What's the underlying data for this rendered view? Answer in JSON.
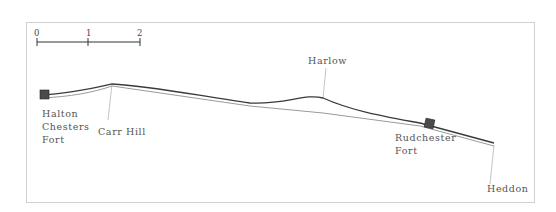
{
  "scale_bar": {
    "ticks": [
      "0",
      "1",
      "2"
    ]
  },
  "places": {
    "halton": {
      "lines": [
        "Halton",
        "Chesters",
        "Fort"
      ]
    },
    "carr_hill": {
      "label": "Carr Hill"
    },
    "harlow": {
      "label": "Harlow"
    },
    "rudchester": {
      "lines": [
        "Rudchester",
        "Fort"
      ]
    },
    "heddon": {
      "label": "Heddon"
    }
  },
  "colors": {
    "wall_line": "#3a3a3a",
    "road_line": "#9a9a9a",
    "fort_fill": "#4a4a4a",
    "frame": "#d0d0d0",
    "label": "#555555"
  }
}
